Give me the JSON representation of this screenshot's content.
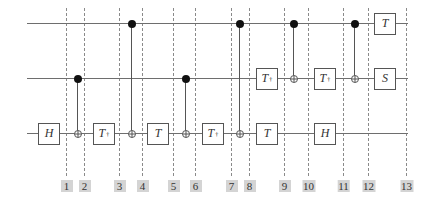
{
  "diagram": {
    "type": "quantum-circuit",
    "wires": [
      {
        "name": "qubit-top",
        "y": 23
      },
      {
        "name": "qubit-middle",
        "y": 78
      },
      {
        "name": "qubit-bottom",
        "y": 133
      }
    ],
    "wire_x_start": 27,
    "wire_x_end": 408,
    "slices": [
      {
        "label": "1",
        "x": 66
      },
      {
        "label": "2",
        "x": 84
      },
      {
        "label": "3",
        "x": 119
      },
      {
        "label": "4",
        "x": 142
      },
      {
        "label": "5",
        "x": 173
      },
      {
        "label": "6",
        "x": 195
      },
      {
        "label": "7",
        "x": 231
      },
      {
        "label": "8",
        "x": 249
      },
      {
        "label": "9",
        "x": 284
      },
      {
        "label": "10",
        "x": 308
      },
      {
        "label": "11",
        "x": 343
      },
      {
        "label": "12",
        "x": 368
      },
      {
        "label": "13",
        "x": 406
      }
    ],
    "gates": [
      {
        "name": "H",
        "dagger": false,
        "wire": 2,
        "x": 49
      },
      {
        "name": "T",
        "dagger": true,
        "wire": 2,
        "x": 104
      },
      {
        "name": "T",
        "dagger": false,
        "wire": 2,
        "x": 158
      },
      {
        "name": "T",
        "dagger": true,
        "wire": 2,
        "x": 213
      },
      {
        "name": "T",
        "dagger": true,
        "wire": 1,
        "x": 267
      },
      {
        "name": "T",
        "dagger": false,
        "wire": 2,
        "x": 267
      },
      {
        "name": "T",
        "dagger": true,
        "wire": 1,
        "x": 325
      },
      {
        "name": "H",
        "dagger": false,
        "wire": 2,
        "x": 325
      },
      {
        "name": "T",
        "dagger": false,
        "wire": 0,
        "x": 385
      },
      {
        "name": "S",
        "dagger": false,
        "wire": 1,
        "x": 385
      }
    ],
    "cnots": [
      {
        "control": 1,
        "target": 2,
        "x": 77
      },
      {
        "control": 0,
        "target": 2,
        "x": 131
      },
      {
        "control": 1,
        "target": 2,
        "x": 185
      },
      {
        "control": 0,
        "target": 2,
        "x": 239
      },
      {
        "control": 0,
        "target": 1,
        "x": 293
      },
      {
        "control": 0,
        "target": 1,
        "x": 354
      }
    ],
    "dagger_symbol": "†",
    "label_y": 180,
    "dash_top": 8,
    "dash_bottom": 176
  }
}
